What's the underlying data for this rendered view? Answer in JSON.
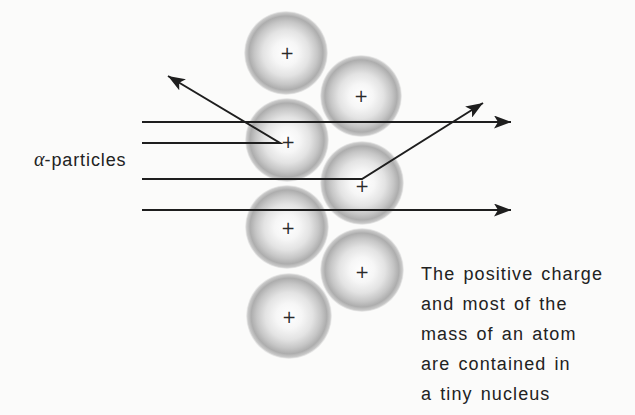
{
  "diagram": {
    "particles_label": {
      "symbol": "α",
      "suffix": "-particles"
    },
    "caption_lines": [
      "The positive charge",
      "and most of the",
      "mass of an atom",
      "are contained in",
      "a tiny nucleus"
    ],
    "nucleus_symbol": "+",
    "atoms": [
      {
        "name": "atom-1",
        "cx": 286,
        "cy": 53,
        "r": 42
      },
      {
        "name": "atom-2",
        "cx": 287,
        "cy": 140,
        "r": 42
      },
      {
        "name": "atom-3",
        "cx": 361,
        "cy": 96,
        "r": 41
      },
      {
        "name": "atom-4",
        "cx": 362,
        "cy": 183,
        "r": 42
      },
      {
        "name": "atom-5",
        "cx": 287,
        "cy": 227,
        "r": 42
      },
      {
        "name": "atom-6",
        "cx": 362,
        "cy": 270,
        "r": 42
      },
      {
        "name": "atom-7",
        "cx": 289,
        "cy": 316,
        "r": 43
      }
    ],
    "nuclei": [
      {
        "x": 287,
        "y": 53
      },
      {
        "x": 288,
        "y": 142
      },
      {
        "x": 361,
        "y": 96
      },
      {
        "x": 362,
        "y": 186
      },
      {
        "x": 288,
        "y": 228
      },
      {
        "x": 362,
        "y": 272
      },
      {
        "x": 289,
        "y": 317
      }
    ],
    "particle_paths": [
      {
        "name": "alpha-path-undeflected-top",
        "points": [
          [
            142,
            122
          ],
          [
            511,
            122
          ]
        ]
      },
      {
        "name": "alpha-path-backscattered",
        "points": [
          [
            142,
            143
          ],
          [
            280,
            143
          ],
          [
            168,
            76
          ]
        ]
      },
      {
        "name": "alpha-path-deflected",
        "points": [
          [
            142,
            179
          ],
          [
            362,
            179
          ],
          [
            483,
            103
          ]
        ]
      },
      {
        "name": "alpha-path-undeflected-bottom",
        "points": [
          [
            142,
            210
          ],
          [
            511,
            210
          ]
        ]
      }
    ],
    "colors": {
      "line": "#1e1e1e",
      "text": "#222222",
      "background": "#fbfbfa",
      "atom_center": "#ffffff",
      "atom_mid": "#e6e6e6",
      "atom_edge": "#ababab"
    }
  }
}
